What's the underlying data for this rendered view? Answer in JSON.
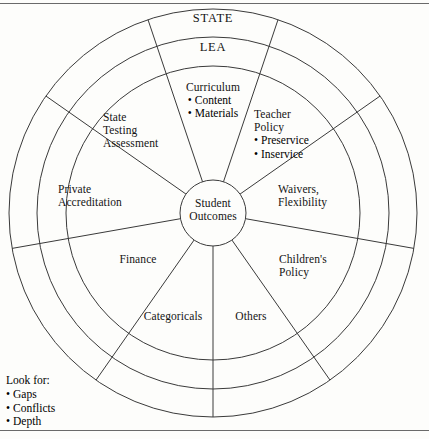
{
  "figure": {
    "type": "concentric-ring-sector-diagram",
    "center_label": "Student\nOutcomes",
    "rings": [
      {
        "name": "outer-ring",
        "label": "STATE"
      },
      {
        "name": "middle-ring",
        "label": "LEA"
      },
      {
        "name": "inner-ring",
        "label": ""
      }
    ],
    "geometry": {
      "center_x": 213,
      "center_y": 213,
      "radii": [
        33,
        147,
        176,
        204
      ],
      "spoke_count": 8
    },
    "colors": {
      "stroke": "#3a3a3a",
      "text": "#141414",
      "background": "#fdfdfb",
      "rule": "#6a6a6a"
    }
  },
  "ring_labels": {
    "state": "STATE",
    "lea": "LEA"
  },
  "center": {
    "line1": "Student",
    "line2": "Outcomes"
  },
  "sectors": [
    {
      "id": "curriculum",
      "title": "Curriculum",
      "bullets": [
        "Content",
        "Materials"
      ]
    },
    {
      "id": "teacher-policy",
      "title_line1": "Teacher",
      "title_line2": "Policy",
      "bullets": [
        "Preservice",
        "Inservice"
      ]
    },
    {
      "id": "waivers-flexibility",
      "line1": "Waivers,",
      "line2": "Flexibility"
    },
    {
      "id": "childrens-policy",
      "line1": "Children's",
      "line2": "Policy"
    },
    {
      "id": "others",
      "line1": "Others"
    },
    {
      "id": "categoricals",
      "line1": "Categoricals"
    },
    {
      "id": "finance",
      "line1": "Finance"
    },
    {
      "id": "private-accreditation",
      "line1": "Private",
      "line2": "Accreditation"
    },
    {
      "id": "state-testing-assessment",
      "line1": "State",
      "line2": "Testing",
      "line3": "Assessment"
    }
  ],
  "look_for": {
    "heading": "Look for:",
    "items": [
      "Gaps",
      "Conflicts",
      "Depth"
    ]
  }
}
